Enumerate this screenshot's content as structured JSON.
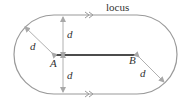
{
  "diagram": {
    "title_label": "locus",
    "points": [
      {
        "name": "A",
        "x": 54,
        "y": 55
      },
      {
        "name": "B",
        "x": 137,
        "y": 55
      }
    ],
    "distance_labels": {
      "upper_left": "d",
      "vertical_up": "d",
      "vertical_down": "d",
      "lower_right": "d"
    },
    "colors": {
      "locus": "#9a9a9a",
      "segment": "#111111",
      "arrows": "#b0b0b0",
      "text": "#333333"
    }
  }
}
